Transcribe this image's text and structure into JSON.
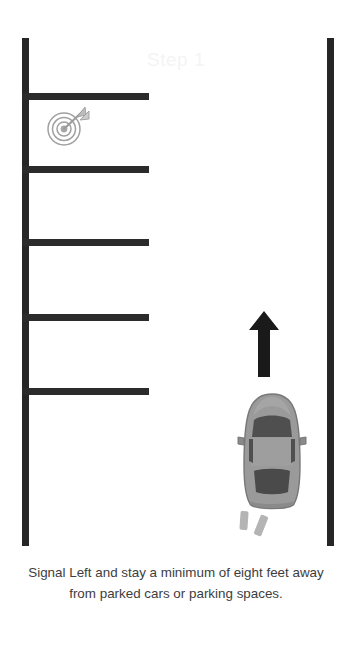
{
  "scene": {
    "width": 352,
    "height": 650,
    "background_color": "#ffffff"
  },
  "step_watermark": {
    "text": "Step 1",
    "color": "#f4f4f4"
  },
  "road": {
    "curb_color": "#262626",
    "stall_line_color": "#2b2b2b",
    "left_curb_name": "left-curb",
    "right_curb_name": "right-curb",
    "stall_lines": [
      {
        "y": 93
      },
      {
        "y": 166
      },
      {
        "y": 239
      },
      {
        "y": 314
      },
      {
        "y": 388
      }
    ]
  },
  "icons": {
    "target": "target-bullseye-with-dart-icon",
    "arrow": "up-arrow-icon",
    "car": "car-top-down-icon"
  },
  "colors": {
    "car_body": "#9a9a9a",
    "car_body_dark": "#8a8a8a",
    "car_glass": "#555555",
    "car_outline": "#6f6f6f",
    "arrow": "#1a1a1a",
    "target_ring": "#9d9d9d",
    "exhaust": "#b4b4b4",
    "caption_text": "#3d3d3d"
  },
  "caption": {
    "line1": "Signal Left and stay a minimum of eight feet",
    "line2": "away from parked cars or parking spaces."
  }
}
